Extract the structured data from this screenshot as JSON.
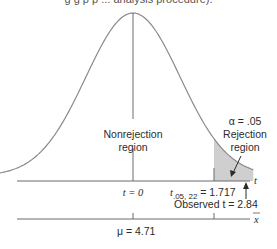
{
  "caption": "g g p     p          ...   analysis procedure).",
  "chart_data": {
    "type": "area",
    "title": "",
    "distribution": "t",
    "degrees_of_freedom": 22,
    "alpha": 0.05,
    "critical_value": 1.717,
    "observed_t": 2.84,
    "mu": 4.71,
    "labels": {
      "alpha": "α = .05",
      "rejection_line1": "Rejection",
      "rejection_line2": "region",
      "nonrejection_line1": "Nonrejection",
      "nonrejection_line2": "region",
      "t_zero": "t = 0",
      "critical_prefix": "t",
      "critical_sub": ".05, 22",
      "critical_suffix": " = 1.717",
      "observed": "Observed t = 2.84",
      "t_axis": "t",
      "xbar_axis": "x̄",
      "mu": "μ  = 4.71"
    },
    "t_range": [
      -3.2,
      2.55
    ],
    "colors": {
      "curve": "#8a8a8a",
      "axis": "#6b6b6b",
      "shade": "#cfcfcf",
      "text": "#2b2b2b"
    }
  }
}
